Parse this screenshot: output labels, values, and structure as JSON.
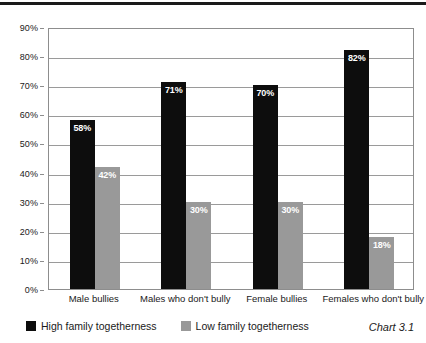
{
  "chart_data": {
    "type": "bar",
    "title": "",
    "subtitle": "",
    "xlabel": "",
    "ylabel": "",
    "ylim": [
      0,
      90
    ],
    "ytick_labels": [
      "0%",
      "10%",
      "20%",
      "30%",
      "40%",
      "50%",
      "60%",
      "70%",
      "80%",
      "90%"
    ],
    "ytick_values": [
      0,
      10,
      20,
      30,
      40,
      50,
      60,
      70,
      80,
      90
    ],
    "grid": "horizontal",
    "legend_position": "bottom-left",
    "categories": [
      "Male bullies",
      "Males who don't bully",
      "Female bullies",
      "Females who don't bully"
    ],
    "series": [
      {
        "name": "High family togetherness",
        "color": "#0d0d0d",
        "values": [
          58,
          71,
          70,
          82
        ],
        "labels": [
          "58%",
          "71%",
          "70%",
          "82%"
        ]
      },
      {
        "name": "Low family togetherness",
        "color": "#999999",
        "values": [
          42,
          30,
          30,
          18
        ],
        "labels": [
          "42%",
          "30%",
          "30%",
          "18%"
        ]
      }
    ],
    "annotations": [
      "Chart 3.1"
    ]
  },
  "legend": {
    "items": [
      {
        "label": "High family togetherness",
        "swatch": "high"
      },
      {
        "label": "Low family togetherness",
        "swatch": "low"
      }
    ]
  },
  "caption": {
    "text": "Chart 3.1"
  }
}
